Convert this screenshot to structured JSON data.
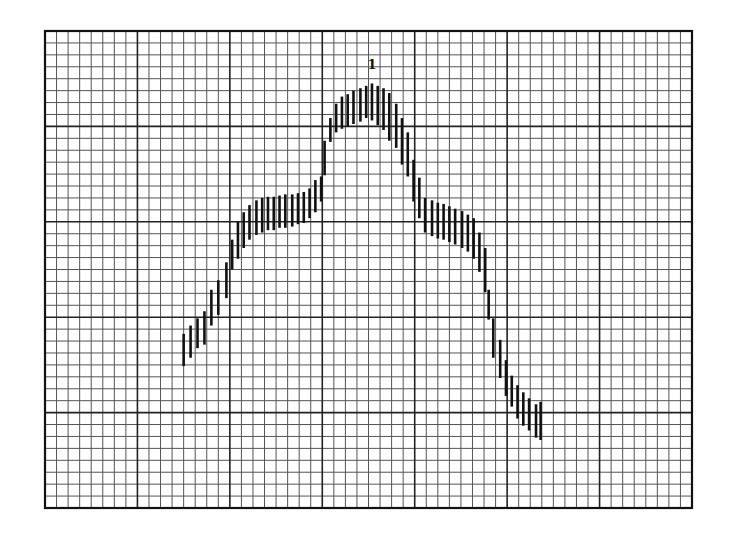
{
  "chart_data": {
    "type": "range-bar",
    "title": "",
    "xlabel": "",
    "ylabel": "",
    "grid": true,
    "grid_major_x": 7,
    "grid_major_y": 5,
    "grid_minor_per_major": 8,
    "xlim": [
      0,
      56
    ],
    "ylim": [
      0,
      40
    ],
    "units_note": "values in minor grid units (x from left frame, y from bottom frame)",
    "annotations": [
      {
        "text": "1",
        "x": 28.3,
        "y": 36.8
      }
    ],
    "series": [
      {
        "name": "range",
        "color": "#111111",
        "points": [
          {
            "x": 12.0,
            "low": 11.9,
            "high": 14.6
          },
          {
            "x": 12.6,
            "low": 12.6,
            "high": 15.3
          },
          {
            "x": 13.2,
            "low": 13.4,
            "high": 15.9
          },
          {
            "x": 13.8,
            "low": 13.7,
            "high": 16.5
          },
          {
            "x": 14.4,
            "low": 15.3,
            "high": 18.3
          },
          {
            "x": 15.0,
            "low": 16.2,
            "high": 19.1
          },
          {
            "x": 15.7,
            "low": 17.6,
            "high": 20.6
          },
          {
            "x": 16.2,
            "low": 20.0,
            "high": 22.5
          },
          {
            "x": 16.7,
            "low": 20.9,
            "high": 24.0
          },
          {
            "x": 17.2,
            "low": 21.8,
            "high": 24.8
          },
          {
            "x": 17.7,
            "low": 22.5,
            "high": 25.4
          },
          {
            "x": 18.3,
            "low": 22.9,
            "high": 25.8
          },
          {
            "x": 18.8,
            "low": 23.1,
            "high": 26.0
          },
          {
            "x": 19.3,
            "low": 23.3,
            "high": 26.1
          },
          {
            "x": 19.8,
            "low": 23.3,
            "high": 26.1
          },
          {
            "x": 20.3,
            "low": 23.5,
            "high": 26.2
          },
          {
            "x": 20.8,
            "low": 23.5,
            "high": 26.3
          },
          {
            "x": 21.4,
            "low": 23.6,
            "high": 26.3
          },
          {
            "x": 21.9,
            "low": 23.8,
            "high": 26.4
          },
          {
            "x": 22.4,
            "low": 23.9,
            "high": 26.5
          },
          {
            "x": 22.9,
            "low": 24.3,
            "high": 26.8
          },
          {
            "x": 23.4,
            "low": 24.8,
            "high": 27.5
          },
          {
            "x": 23.9,
            "low": 25.7,
            "high": 27.8
          },
          {
            "x": 24.2,
            "low": 27.9,
            "high": 30.8
          },
          {
            "x": 24.7,
            "low": 30.7,
            "high": 32.7
          },
          {
            "x": 25.2,
            "low": 31.5,
            "high": 33.9
          },
          {
            "x": 25.7,
            "low": 31.8,
            "high": 34.5
          },
          {
            "x": 26.2,
            "low": 32.0,
            "high": 34.7
          },
          {
            "x": 26.7,
            "low": 32.2,
            "high": 35.0
          },
          {
            "x": 27.3,
            "low": 32.4,
            "high": 35.2
          },
          {
            "x": 27.8,
            "low": 32.7,
            "high": 35.4
          },
          {
            "x": 28.3,
            "low": 32.5,
            "high": 35.6
          },
          {
            "x": 28.8,
            "low": 32.1,
            "high": 35.4
          },
          {
            "x": 29.3,
            "low": 31.7,
            "high": 35.2
          },
          {
            "x": 29.8,
            "low": 30.8,
            "high": 34.8
          },
          {
            "x": 30.4,
            "low": 30.2,
            "high": 33.9
          },
          {
            "x": 30.9,
            "low": 28.8,
            "high": 32.7
          },
          {
            "x": 31.4,
            "low": 27.8,
            "high": 31.5
          },
          {
            "x": 31.9,
            "low": 25.7,
            "high": 29.2
          },
          {
            "x": 32.4,
            "low": 24.3,
            "high": 27.7
          },
          {
            "x": 32.9,
            "low": 23.1,
            "high": 26.0
          },
          {
            "x": 33.5,
            "low": 22.8,
            "high": 25.8
          },
          {
            "x": 34.0,
            "low": 22.6,
            "high": 25.6
          },
          {
            "x": 34.5,
            "low": 22.5,
            "high": 25.5
          },
          {
            "x": 35.0,
            "low": 22.3,
            "high": 25.3
          },
          {
            "x": 35.5,
            "low": 22.1,
            "high": 25.1
          },
          {
            "x": 36.1,
            "low": 21.8,
            "high": 24.9
          },
          {
            "x": 36.6,
            "low": 21.5,
            "high": 24.6
          },
          {
            "x": 37.1,
            "low": 20.9,
            "high": 24.3
          },
          {
            "x": 37.6,
            "low": 19.8,
            "high": 23.1
          },
          {
            "x": 38.1,
            "low": 18.1,
            "high": 21.8
          },
          {
            "x": 38.4,
            "low": 15.8,
            "high": 18.3
          },
          {
            "x": 38.8,
            "low": 12.6,
            "high": 15.9
          },
          {
            "x": 39.4,
            "low": 10.9,
            "high": 14.1
          },
          {
            "x": 39.9,
            "low": 9.4,
            "high": 12.4
          },
          {
            "x": 40.4,
            "low": 8.5,
            "high": 11.1
          },
          {
            "x": 40.9,
            "low": 7.5,
            "high": 10.3
          },
          {
            "x": 41.4,
            "low": 6.9,
            "high": 9.7
          },
          {
            "x": 41.9,
            "low": 6.5,
            "high": 9.2
          },
          {
            "x": 42.5,
            "low": 5.9,
            "high": 8.7
          },
          {
            "x": 42.9,
            "low": 5.7,
            "high": 8.9
          }
        ]
      }
    ]
  }
}
